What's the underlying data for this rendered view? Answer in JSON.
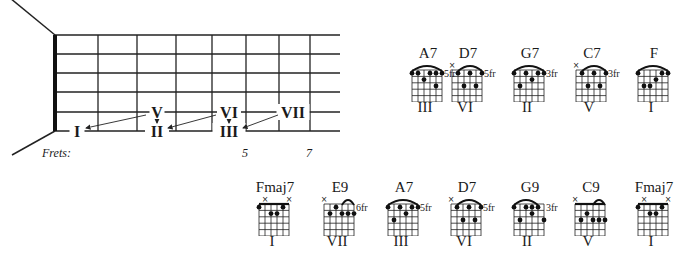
{
  "title_partial": "",
  "fretboard": {
    "frets_label": "Frets:",
    "fret_numbers": [
      {
        "label": "5",
        "x": 246
      },
      {
        "label": "7",
        "x": 310
      }
    ],
    "nut_x": 55,
    "fret_x": [
      98,
      137,
      176,
      212,
      246,
      279,
      310
    ],
    "string_y": [
      35,
      54,
      73,
      92,
      112,
      131
    ],
    "string_end_x": 340,
    "degree_labels": [
      {
        "label": "I",
        "x": 77,
        "y": 131
      },
      {
        "label": "II",
        "x": 157,
        "y": 131
      },
      {
        "label": "III",
        "x": 229,
        "y": 131
      },
      {
        "label": "V",
        "x": 157,
        "y": 112
      },
      {
        "label": "VI",
        "x": 229,
        "y": 112
      },
      {
        "label": "VII",
        "x": 293,
        "y": 112
      }
    ],
    "arrows": [
      {
        "from": "V",
        "to": "I",
        "x1": 146,
        "y1": 115,
        "x2": 86,
        "y2": 128
      },
      {
        "from": "V",
        "to": "II",
        "x1": 157,
        "y1": 120,
        "x2": 157,
        "y2": 123
      },
      {
        "from": "VI",
        "to": "II",
        "x1": 216,
        "y1": 115,
        "x2": 168,
        "y2": 128
      },
      {
        "from": "VI",
        "to": "III",
        "x1": 229,
        "y1": 120,
        "x2": 229,
        "y2": 123
      },
      {
        "from": "VII",
        "to": "III",
        "x1": 278,
        "y1": 115,
        "x2": 243,
        "y2": 128
      }
    ]
  },
  "chords_row1": [
    {
      "name": "A7",
      "degree": "III",
      "fret_label": "5fr",
      "x": 428,
      "y": 46,
      "muted": [],
      "barre": [
        0,
        5
      ],
      "dots": [
        [
          0,
          1
        ],
        [
          1,
          1
        ],
        [
          2,
          2
        ],
        [
          3,
          1
        ],
        [
          4,
          1
        ],
        [
          5,
          1
        ],
        [
          4,
          3
        ]
      ]
    },
    {
      "name": "D7",
      "degree": "VI",
      "fret_label": "5fr",
      "x": 468,
      "y": 46,
      "muted": [
        0
      ],
      "barre": [
        1,
        5
      ],
      "dots": [
        [
          1,
          1
        ],
        [
          3,
          1
        ],
        [
          5,
          1
        ],
        [
          2,
          3
        ],
        [
          4,
          3
        ]
      ]
    },
    {
      "name": "G7",
      "degree": "II",
      "fret_label": "3fr",
      "x": 530,
      "y": 46,
      "muted": [],
      "barre": [
        0,
        5
      ],
      "dots": [
        [
          0,
          1
        ],
        [
          2,
          1
        ],
        [
          4,
          1
        ],
        [
          5,
          1
        ],
        [
          3,
          2
        ],
        [
          1,
          3
        ]
      ]
    },
    {
      "name": "C7",
      "degree": "V",
      "fret_label": "3fr",
      "x": 592,
      "y": 46,
      "muted": [
        0
      ],
      "barre": [
        1,
        5
      ],
      "dots": [
        [
          1,
          1
        ],
        [
          3,
          1
        ],
        [
          5,
          1
        ],
        [
          2,
          3
        ],
        [
          4,
          3
        ]
      ]
    },
    {
      "name": "F",
      "degree": "I",
      "fret_label": "",
      "x": 654,
      "y": 46,
      "muted": [],
      "barre": [
        0,
        5
      ],
      "dots": [
        [
          0,
          1
        ],
        [
          4,
          1
        ],
        [
          5,
          1
        ],
        [
          3,
          2
        ],
        [
          1,
          3
        ],
        [
          2,
          3
        ]
      ]
    }
  ],
  "chords_row2": [
    {
      "name": "Fmaj7",
      "degree": "I",
      "fret_label": "",
      "x": 275,
      "y": 180,
      "muted": [
        1,
        5
      ],
      "barre": null,
      "top_line": true,
      "dots": [
        [
          0,
          1
        ],
        [
          4,
          1
        ],
        [
          2,
          2
        ],
        [
          3,
          2
        ]
      ]
    },
    {
      "name": "E9",
      "degree": "VII",
      "fret_label": "6fr",
      "x": 340,
      "y": 180,
      "muted": [
        0
      ],
      "barre": [
        3,
        5
      ],
      "dots": [
        [
          1,
          2
        ],
        [
          2,
          1
        ],
        [
          3,
          2
        ],
        [
          4,
          2
        ],
        [
          5,
          2
        ]
      ]
    },
    {
      "name": "A7",
      "degree": "III",
      "fret_label": "5fr",
      "x": 404,
      "y": 180,
      "muted": [],
      "barre": [
        0,
        5
      ],
      "dots": [
        [
          0,
          1
        ],
        [
          2,
          1
        ],
        [
          4,
          1
        ],
        [
          5,
          1
        ],
        [
          3,
          2
        ],
        [
          1,
          3
        ]
      ]
    },
    {
      "name": "D7",
      "degree": "VI",
      "fret_label": "5fr",
      "x": 467,
      "y": 180,
      "muted": [
        0
      ],
      "barre": [
        1,
        5
      ],
      "dots": [
        [
          1,
          1
        ],
        [
          3,
          1
        ],
        [
          5,
          1
        ],
        [
          2,
          3
        ],
        [
          4,
          3
        ]
      ]
    },
    {
      "name": "G9",
      "degree": "II",
      "fret_label": "3fr",
      "x": 530,
      "y": 180,
      "muted": [],
      "barre": [
        0,
        4
      ],
      "dots": [
        [
          0,
          1
        ],
        [
          2,
          1
        ],
        [
          3,
          1
        ],
        [
          4,
          1
        ],
        [
          3,
          2
        ],
        [
          1,
          3
        ],
        [
          5,
          3
        ]
      ]
    },
    {
      "name": "C9",
      "degree": "V",
      "fret_label": "",
      "x": 591,
      "y": 180,
      "muted": [
        0
      ],
      "barre": [
        3,
        5
      ],
      "top_line": true,
      "dots": [
        [
          1,
          3
        ],
        [
          2,
          2
        ],
        [
          3,
          3
        ],
        [
          4,
          3
        ],
        [
          5,
          3
        ]
      ]
    },
    {
      "name": "Fmaj7",
      "degree": "I",
      "fret_label": "",
      "x": 654,
      "y": 180,
      "muted": [
        1,
        5
      ],
      "barre": null,
      "top_line": true,
      "dots": [
        [
          0,
          1
        ],
        [
          4,
          1
        ],
        [
          2,
          2
        ],
        [
          3,
          2
        ]
      ]
    }
  ]
}
